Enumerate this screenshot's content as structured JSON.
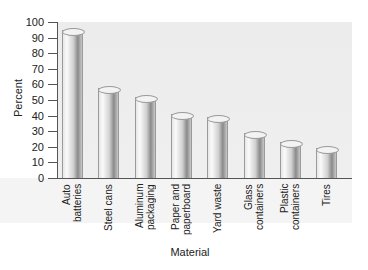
{
  "chart_data": {
    "type": "bar",
    "title": "",
    "xlabel": "Material",
    "ylabel": "Percent",
    "ylim": [
      0,
      100
    ],
    "yticks": [
      0,
      10,
      20,
      30,
      40,
      50,
      60,
      70,
      80,
      90,
      100
    ],
    "grid": false,
    "legend": null,
    "categories": [
      "Auto\nbatteries",
      "Steel cans",
      "Aluminum\npackaging",
      "Paper and\npaperboard",
      "Yard waste",
      "Glass\ncontainers",
      "Plastic\ncontainers",
      "Tires"
    ],
    "values": [
      95,
      58,
      52,
      41,
      39,
      29,
      23,
      19
    ]
  },
  "axis": {
    "y_title": "Percent",
    "x_title": "Material",
    "ticks": [
      "0",
      "10",
      "20",
      "30",
      "40",
      "50",
      "60",
      "70",
      "80",
      "90",
      "100"
    ]
  },
  "colors": {
    "plot_background": "#ececec",
    "bar_light": "#fafafa",
    "bar_dark": "#8a8a8a",
    "axis": "#555555"
  }
}
